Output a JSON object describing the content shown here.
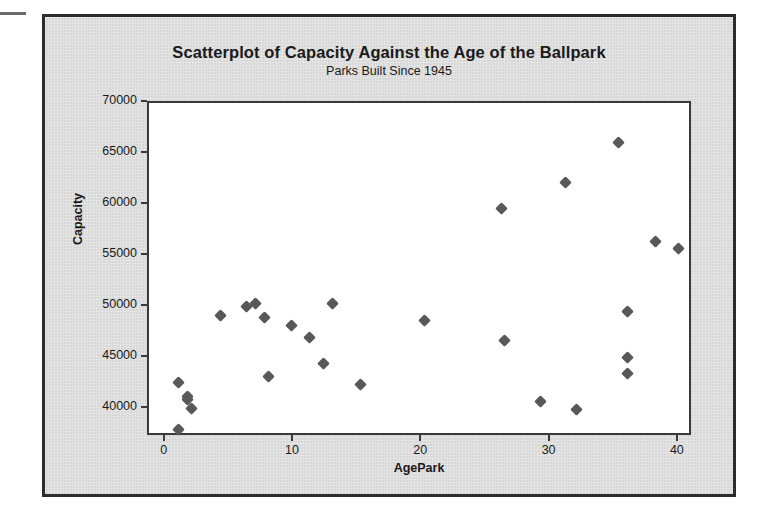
{
  "chart_data": {
    "type": "scatter",
    "title": "Scatterplot of Capacity Against the Age of the Ballpark",
    "subtitle": "Parks Built Since 1945",
    "xlabel": "AgePark",
    "ylabel": "Capacity",
    "xlim": [
      -1.3,
      41.1
    ],
    "ylim": [
      37300,
      70000
    ],
    "xticks": [
      0,
      10,
      20,
      30,
      40
    ],
    "xtick_labels": [
      "0",
      "10",
      "20",
      "30",
      "40"
    ],
    "yticks": [
      40000,
      45000,
      50000,
      55000,
      60000,
      65000,
      70000
    ],
    "ytick_labels": [
      "40000",
      "45000",
      "50000",
      "55000",
      "60000",
      "65000",
      "70000"
    ],
    "grid": false,
    "legend": false,
    "marker": "diamond",
    "marker_color": "#585858",
    "panel_background": "#ffffff",
    "board_background": "#d8d8d8",
    "frame_color": "#2c2c2c",
    "points": [
      {
        "x": 1.0,
        "y": 38000
      },
      {
        "x": 1.0,
        "y": 42600
      },
      {
        "x": 1.7,
        "y": 41300
      },
      {
        "x": 1.7,
        "y": 41000
      },
      {
        "x": 2.0,
        "y": 40100
      },
      {
        "x": 4.3,
        "y": 49200
      },
      {
        "x": 6.3,
        "y": 50100
      },
      {
        "x": 7.0,
        "y": 50400
      },
      {
        "x": 7.7,
        "y": 49000
      },
      {
        "x": 8.0,
        "y": 43200
      },
      {
        "x": 9.8,
        "y": 48200
      },
      {
        "x": 11.2,
        "y": 47000
      },
      {
        "x": 12.3,
        "y": 44500
      },
      {
        "x": 13.0,
        "y": 50400
      },
      {
        "x": 15.2,
        "y": 42400
      },
      {
        "x": 20.2,
        "y": 48700
      },
      {
        "x": 26.2,
        "y": 59700
      },
      {
        "x": 26.4,
        "y": 46700
      },
      {
        "x": 29.2,
        "y": 40800
      },
      {
        "x": 31.2,
        "y": 62200
      },
      {
        "x": 32.0,
        "y": 40000
      },
      {
        "x": 35.3,
        "y": 66100
      },
      {
        "x": 36.0,
        "y": 49600
      },
      {
        "x": 36.0,
        "y": 45100
      },
      {
        "x": 36.0,
        "y": 43500
      },
      {
        "x": 38.2,
        "y": 56400
      },
      {
        "x": 40.0,
        "y": 55800
      }
    ]
  }
}
